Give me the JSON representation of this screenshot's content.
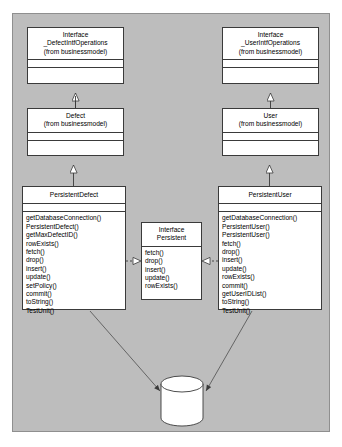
{
  "diagram": {
    "type": "uml-class-diagram",
    "canvas_color": "#bdbdbd",
    "node_fill": "#ffffff",
    "line_color": "#3a3a3a",
    "nodes": [
      {
        "id": "iface_defect",
        "stereotype": "Interface",
        "name": "_DefectIntfOperations",
        "package": "(from businessmodel)",
        "attributes": [],
        "operations": []
      },
      {
        "id": "iface_user",
        "stereotype": "Interface",
        "name": "_UserIntfOperations",
        "package": "(from businessmodel)",
        "attributes": [],
        "operations": []
      },
      {
        "id": "defect",
        "stereotype": "",
        "name": "Defect",
        "package": "(from businessmodel)",
        "attributes": [],
        "operations": []
      },
      {
        "id": "user",
        "stereotype": "",
        "name": "User",
        "package": "(from businessmodel)",
        "attributes": [],
        "operations": []
      },
      {
        "id": "persistent_defect",
        "stereotype": "",
        "name": "PersistentDefect",
        "package": "",
        "attributes": [],
        "operations": [
          "getDatabaseConnection()",
          "PersistentDefect()",
          "getMaxDefectID()",
          "rowExists()",
          "fetch()",
          "drop()",
          "insert()",
          "update()",
          "setPolicy()",
          "commit()",
          "toString()",
          "TestUnit()"
        ]
      },
      {
        "id": "persistent_user",
        "stereotype": "",
        "name": "PersistentUser",
        "package": "",
        "attributes": [],
        "operations": [
          "getDatabaseConnection()",
          "PersistentUser()",
          "PersistentUser()",
          "fetch()",
          "drop()",
          "insert()",
          "update()",
          "rowExists()",
          "commit()",
          "getUserIDList()",
          "toString()",
          "TestUnit()"
        ]
      },
      {
        "id": "iface_persistent",
        "stereotype": "Interface",
        "name": "Persistent",
        "package": "",
        "attributes": [],
        "operations": [
          "fetch()",
          "drop()",
          "insert()",
          "update()",
          "rowExists()"
        ]
      },
      {
        "id": "database",
        "shape": "cylinder",
        "name": ""
      }
    ],
    "relationships": [
      {
        "from": "defect",
        "to": "iface_defect",
        "kind": "generalization"
      },
      {
        "from": "user",
        "to": "iface_user",
        "kind": "generalization"
      },
      {
        "from": "persistent_defect",
        "to": "defect",
        "kind": "generalization"
      },
      {
        "from": "persistent_user",
        "to": "user",
        "kind": "generalization"
      },
      {
        "from": "persistent_defect",
        "to": "iface_persistent",
        "kind": "realization"
      },
      {
        "from": "persistent_user",
        "to": "iface_persistent",
        "kind": "realization"
      },
      {
        "from": "persistent_defect",
        "to": "database",
        "kind": "dependency"
      },
      {
        "from": "persistent_user",
        "to": "database",
        "kind": "dependency"
      }
    ]
  }
}
